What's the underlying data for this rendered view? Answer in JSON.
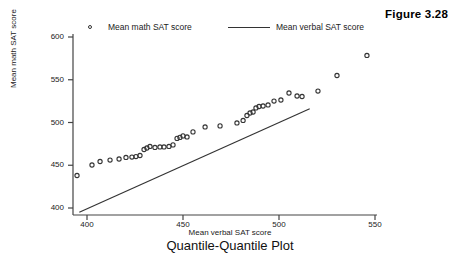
{
  "figure_label": "Figure 3.28",
  "legend": {
    "items": [
      {
        "label": "Mean math SAT score",
        "marker": "open-circle",
        "color": "#333333"
      },
      {
        "label": "Mean verbal SAT score",
        "marker": "line",
        "color": "#333333"
      }
    ]
  },
  "chart_data": {
    "type": "scatter",
    "title": "Quantile-Quantile Plot",
    "xlabel": "Mean verbal SAT score",
    "ylabel": "Mean math SAT score",
    "xlim": [
      392,
      555
    ],
    "ylim": [
      392,
      610
    ],
    "xticks": [
      400,
      450,
      500,
      550
    ],
    "yticks": [
      400,
      450,
      500,
      550,
      600
    ],
    "grid": false,
    "legend_position": "top",
    "series": [
      {
        "name": "Mean math SAT score",
        "type": "scatter",
        "marker": "open-circle",
        "color": "#333333",
        "points": [
          [
            394.8,
            438.0
          ],
          [
            402.6,
            450.3
          ],
          [
            406.8,
            454.4
          ],
          [
            412.0,
            456.1
          ],
          [
            416.7,
            457.3
          ],
          [
            420.3,
            459.1
          ],
          [
            423.4,
            459.6
          ],
          [
            425.5,
            460.2
          ],
          [
            427.6,
            461.4
          ],
          [
            429.7,
            468.4
          ],
          [
            431.2,
            470.2
          ],
          [
            432.8,
            472.0
          ],
          [
            435.4,
            470.8
          ],
          [
            438.0,
            471.4
          ],
          [
            440.1,
            471.4
          ],
          [
            442.7,
            472.0
          ],
          [
            444.8,
            473.8
          ],
          [
            446.9,
            481.4
          ],
          [
            448.4,
            482.6
          ],
          [
            450.0,
            484.3
          ],
          [
            452.1,
            483.1
          ],
          [
            455.2,
            489.0
          ],
          [
            461.5,
            494.8
          ],
          [
            469.3,
            496.0
          ],
          [
            478.1,
            499.5
          ],
          [
            481.3,
            502.4
          ],
          [
            483.3,
            508.2
          ],
          [
            484.9,
            511.1
          ],
          [
            486.5,
            512.3
          ],
          [
            488.0,
            517.0
          ],
          [
            489.6,
            518.7
          ],
          [
            491.7,
            519.3
          ],
          [
            494.3,
            520.5
          ],
          [
            497.4,
            525.1
          ],
          [
            501.0,
            526.3
          ],
          [
            505.2,
            534.5
          ],
          [
            509.4,
            531.0
          ],
          [
            512.0,
            530.4
          ],
          [
            520.3,
            536.8
          ],
          [
            530.2,
            555.0
          ],
          [
            545.8,
            578.4
          ]
        ]
      },
      {
        "name": "Mean verbal SAT score",
        "type": "line",
        "color": "#333333",
        "points": [
          [
            396.0,
            395.0
          ],
          [
            516.0,
            516.0
          ]
        ]
      }
    ]
  }
}
